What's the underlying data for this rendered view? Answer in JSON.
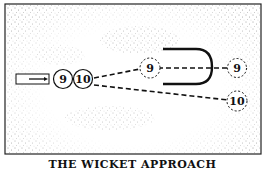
{
  "caption": "THE WICKET APPROACH",
  "players": {
    "start_9": "9",
    "start_10": "10",
    "end_9_mid": "9",
    "end_9_right": "9",
    "end_10_right": "10"
  }
}
